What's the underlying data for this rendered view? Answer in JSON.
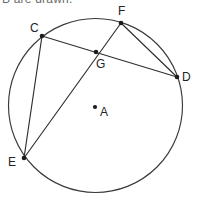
{
  "figure": {
    "title_fragment": "B are drawn.",
    "background_color": "#ffffff",
    "stroke_color": "#2e2e2e",
    "vertex_color": "#1c1c1c",
    "width": 198,
    "height": 204,
    "circle": {
      "center_label": "A",
      "cx": 95.5,
      "cy": 105.5,
      "r": 87
    },
    "points": [
      {
        "label": "C",
        "x": 42,
        "y": 36,
        "label_x": 30,
        "label_y": 22
      },
      {
        "label": "F",
        "x": 121,
        "y": 23,
        "label_x": 118,
        "label_y": 5
      },
      {
        "label": "D",
        "x": 177,
        "y": 77,
        "label_x": 182,
        "label_y": 71
      },
      {
        "label": "G",
        "x": 96,
        "y": 52,
        "label_x": 96,
        "label_y": 58
      },
      {
        "label": "E",
        "x": 24,
        "y": 158,
        "label_x": 8,
        "label_y": 156
      },
      {
        "label": "A",
        "x": 95,
        "y": 107,
        "label_x": 100,
        "label_y": 106
      }
    ],
    "chords": [
      {
        "name": "chord-c-d",
        "from": "C",
        "to": "D",
        "x1": 42,
        "y1": 36,
        "x2": 177,
        "y2": 77
      },
      {
        "name": "chord-e-f",
        "from": "E",
        "to": "F",
        "x1": 24,
        "y1": 158,
        "x2": 121,
        "y2": 23
      },
      {
        "name": "chord-c-e",
        "from": "C",
        "to": "E",
        "x1": 42,
        "y1": 36,
        "x2": 24,
        "y2": 158
      },
      {
        "name": "chord-f-d",
        "from": "F",
        "to": "D",
        "x1": 121,
        "y1": 23,
        "x2": 177,
        "y2": 77
      }
    ],
    "intersection_label": "G"
  }
}
